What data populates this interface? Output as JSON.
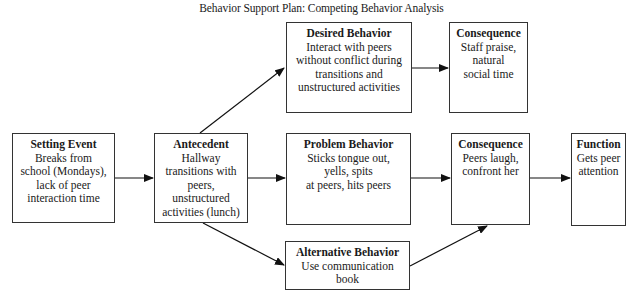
{
  "title": "Behavior Support Plan: Competing Behavior Analysis",
  "boxes": {
    "setting_event": {
      "heading": "Setting Event",
      "body": "Breaks from\nschool (Mondays),\nlack of peer\ninteraction time"
    },
    "antecedent": {
      "heading": "Antecedent",
      "body": "Hallway\ntransitions with\npeers,\nunstructured\nactivities (lunch)"
    },
    "desired_behavior": {
      "heading": "Desired Behavior",
      "body": "Interact with peers\nwithout conflict during\ntransitions and\nunstructured activities"
    },
    "desired_consequence": {
      "heading": "Consequence",
      "body": "Staff praise,\nnatural\nsocial time"
    },
    "problem_behavior": {
      "heading": "Problem Behavior",
      "body": "Sticks tongue out,\nyells, spits\nat peers, hits peers"
    },
    "problem_consequence": {
      "heading": "Consequence",
      "body": "Peers laugh,\nconfront her"
    },
    "function": {
      "heading": "Function",
      "body": "Gets peer\nattention"
    },
    "alternative_behavior": {
      "heading": "Alternative Behavior",
      "body": "Use communication\nbook"
    }
  },
  "connections": [
    {
      "from": "setting_event",
      "to": "antecedent"
    },
    {
      "from": "antecedent",
      "to": "desired_behavior"
    },
    {
      "from": "antecedent",
      "to": "problem_behavior"
    },
    {
      "from": "antecedent",
      "to": "alternative_behavior"
    },
    {
      "from": "desired_behavior",
      "to": "desired_consequence"
    },
    {
      "from": "problem_behavior",
      "to": "problem_consequence"
    },
    {
      "from": "alternative_behavior",
      "to": "problem_consequence"
    },
    {
      "from": "problem_consequence",
      "to": "function"
    }
  ]
}
